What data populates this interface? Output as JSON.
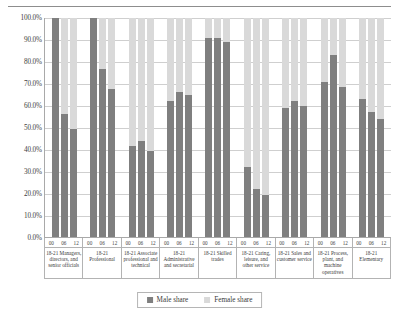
{
  "chart_data": {
    "type": "bar",
    "title": "",
    "xlabel": "",
    "ylabel": "",
    "ylim": [
      0,
      100
    ],
    "grid": true,
    "legend_position": "bottom",
    "unit": "%",
    "stacked": true,
    "y_ticks": [
      "100.0%",
      "90.0%",
      "80.0%",
      "70.0%",
      "60.0%",
      "50.0%",
      "40.0%",
      "30.0%",
      "20.0%",
      "10.0%",
      "0.0%"
    ],
    "y_tick_values": [
      100,
      90,
      80,
      70,
      60,
      50,
      40,
      30,
      20,
      10,
      0
    ],
    "sub_categories": [
      "00",
      "06",
      "12"
    ],
    "categories": [
      "18-21 Managers, directors, and senior officials",
      "18-21 Professional",
      "18-21 Associate professional and technical",
      "18-21 Administrative and secretarial",
      "18-21 Skilled trades",
      "18-21 Caring, leisure, and other service",
      "18-21 Sales and customer service",
      "18-21 Process, plant, and machine operatives",
      "18-21 Elementary"
    ],
    "series": [
      {
        "name": "Male share",
        "color": "#7f7f7f",
        "values": [
          [
            100.0,
            56.0,
            49.5
          ],
          [
            100.0,
            76.5,
            67.5
          ],
          [
            41.5,
            44.0,
            39.5
          ],
          [
            62.0,
            66.0,
            65.0
          ],
          [
            91.0,
            91.0,
            89.0
          ],
          [
            32.0,
            22.0,
            19.0
          ],
          [
            59.0,
            62.0,
            60.0
          ],
          [
            71.0,
            83.0,
            68.5
          ],
          [
            63.0,
            57.0,
            54.0
          ]
        ]
      },
      {
        "name": "Female share",
        "color": "#d9d9d9",
        "values": [
          [
            0.0,
            44.0,
            50.5
          ],
          [
            0.0,
            23.5,
            32.5
          ],
          [
            58.5,
            56.0,
            60.5
          ],
          [
            38.0,
            34.0,
            35.0
          ],
          [
            9.0,
            9.0,
            11.0
          ],
          [
            68.0,
            78.0,
            81.0
          ],
          [
            41.0,
            38.0,
            40.0
          ],
          [
            29.0,
            17.0,
            31.5
          ],
          [
            37.0,
            43.0,
            46.0
          ]
        ]
      }
    ]
  },
  "legend": {
    "items": [
      {
        "label": "Male share",
        "color": "#7f7f7f"
      },
      {
        "label": "Female share",
        "color": "#d9d9d9"
      }
    ]
  }
}
